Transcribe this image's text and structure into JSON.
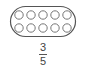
{
  "figure": {
    "container_shape": "rounded-rectangle",
    "rows": 2,
    "columns": 5,
    "circle_count": 10,
    "stroke_color": "#555555",
    "background": "#ffffff"
  },
  "fraction": {
    "numerator": "3",
    "denominator": "5"
  }
}
